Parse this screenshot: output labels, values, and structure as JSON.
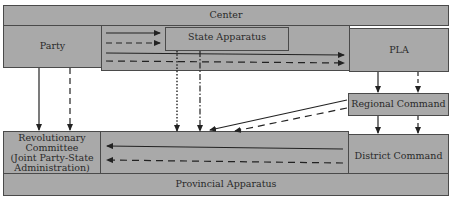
{
  "diagram": {
    "nodes": {
      "center": {
        "label": "Center"
      },
      "party": {
        "label": "Party"
      },
      "state_apparatus": {
        "label": "State Apparatus"
      },
      "pla": {
        "label": "PLA"
      },
      "regional_command": {
        "label": "Regional Command"
      },
      "revolutionary_committee": {
        "label": "Revolutionary Committee (Joint Party-State Administration)",
        "lines": [
          "Revolutionary",
          "Committee",
          "(Joint Party-State",
          "Administration)"
        ]
      },
      "district_command": {
        "label": "District Command"
      },
      "provincial_apparatus": {
        "label": "Provincial Apparatus"
      }
    },
    "edges": [
      {
        "from": "party",
        "to": "state_apparatus",
        "style": "solid"
      },
      {
        "from": "party",
        "to": "state_apparatus",
        "style": "dashed"
      },
      {
        "from": "party",
        "to": "pla",
        "style": "solid"
      },
      {
        "from": "party",
        "to": "pla",
        "style": "dashed"
      },
      {
        "from": "party",
        "to": "revolutionary_committee",
        "style": "solid"
      },
      {
        "from": "party",
        "to": "revolutionary_committee",
        "style": "dashed"
      },
      {
        "from": "state_apparatus",
        "to": "revolutionary_committee",
        "style": "dotted"
      },
      {
        "from": "state_apparatus",
        "to": "revolutionary_committee",
        "style": "dash-dot"
      },
      {
        "from": "pla",
        "to": "regional_command",
        "style": "solid"
      },
      {
        "from": "pla",
        "to": "regional_command",
        "style": "dashed"
      },
      {
        "from": "regional_command",
        "to": "district_command",
        "style": "solid"
      },
      {
        "from": "regional_command",
        "to": "district_command",
        "style": "dashed"
      },
      {
        "from": "regional_command",
        "to": "revolutionary_committee",
        "style": "solid"
      },
      {
        "from": "regional_command",
        "to": "revolutionary_committee",
        "style": "dashed"
      },
      {
        "from": "district_command",
        "to": "revolutionary_committee",
        "style": "solid"
      },
      {
        "from": "district_command",
        "to": "revolutionary_committee",
        "style": "dashed"
      }
    ],
    "colors": {
      "box_fill": "#a9a9a9",
      "border": "#4a4a4a",
      "arrow": "#222222"
    }
  }
}
